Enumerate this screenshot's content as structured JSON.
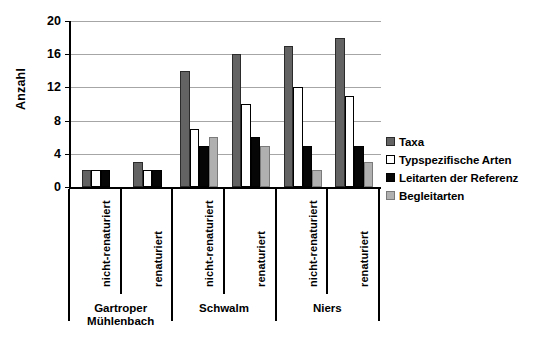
{
  "chart_data": {
    "type": "bar",
    "title": "",
    "xlabel": "",
    "ylabel": "Anzahl",
    "ylim": [
      0,
      20
    ],
    "yticks": [
      0,
      4,
      8,
      12,
      16,
      20
    ],
    "ytick_labels": [
      "0",
      "4",
      "8",
      "12",
      "16",
      "20"
    ],
    "grid": true,
    "legend_position": "right",
    "groups": [
      "Gartroper Mühlenbach",
      "Schwalm",
      "Niers"
    ],
    "categories": [
      "nicht-renaturiert",
      "renaturiert",
      "nicht-renaturiert",
      "renaturiert",
      "nicht-renaturiert",
      "renaturiert"
    ],
    "series": [
      {
        "name": "Taxa",
        "color": "#636363",
        "values": [
          2,
          3,
          14,
          16,
          17,
          18
        ]
      },
      {
        "name": "Typspezifische Arten",
        "color": "#ffffff",
        "values": [
          2,
          2,
          7,
          10,
          12,
          11
        ]
      },
      {
        "name": "Leitarten der Referenz",
        "color": "#060606",
        "values": [
          2,
          2,
          5,
          6,
          5,
          5
        ]
      },
      {
        "name": "Begleitarten",
        "color": "#b0b0b0",
        "values": [
          null,
          null,
          6,
          5,
          2,
          3
        ]
      }
    ]
  },
  "legend": {
    "items": [
      {
        "label": "Taxa",
        "key": "taxa"
      },
      {
        "label": "Typspezifische Arten",
        "key": "typ"
      },
      {
        "label": "Leitarten der Referenz",
        "key": "leit"
      },
      {
        "label": "Begleitarten",
        "key": "begleit"
      }
    ]
  }
}
